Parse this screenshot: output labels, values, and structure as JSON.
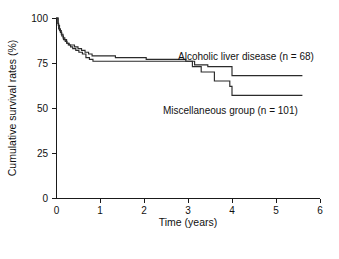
{
  "chart_data": {
    "type": "line",
    "subtype": "kaplan-meier-step",
    "title": "",
    "xlabel": "Time (years)",
    "ylabel": "Cumulative survival rates (%)",
    "xlim": [
      0,
      6
    ],
    "ylim": [
      0,
      100
    ],
    "xticks": [
      0,
      1,
      2,
      3,
      4,
      5,
      6
    ],
    "xtick_labels": [
      "0",
      "1",
      "2",
      "3",
      "4",
      "5",
      "6"
    ],
    "yticks": [
      0,
      25,
      50,
      75,
      100
    ],
    "ytick_labels": [
      "0",
      "25",
      "50",
      "75",
      "100"
    ],
    "grid": false,
    "legend_position": "inline-annotation",
    "line_color": "#2b2b2b",
    "series": [
      {
        "name": "Alcoholic liver disease (n = 68)",
        "annotation": "Alcoholic liver disease (n = 68)",
        "n": 68,
        "final_value": 68,
        "x": [
          0.0,
          0.04,
          0.06,
          0.1,
          0.13,
          0.17,
          0.21,
          0.25,
          0.3,
          0.36,
          0.42,
          0.5,
          0.58,
          0.66,
          0.74,
          0.82,
          0.95,
          1.35,
          1.55,
          2.05,
          2.3,
          2.95,
          3.15,
          3.45,
          4.0,
          5.6
        ],
        "y": [
          100,
          97,
          94,
          92,
          90,
          88,
          87,
          86,
          85,
          85,
          84,
          83,
          82,
          81,
          80,
          79,
          79,
          78,
          78,
          77,
          77,
          76,
          74,
          73,
          68,
          68
        ],
        "step": "post"
      },
      {
        "name": "Miscellaneous group (n = 101)",
        "annotation": "Miscellaneous group (n = 101)",
        "n": 101,
        "final_value": 57,
        "x": [
          0.0,
          0.05,
          0.08,
          0.12,
          0.16,
          0.2,
          0.24,
          0.28,
          0.33,
          0.38,
          0.45,
          0.52,
          0.6,
          0.68,
          0.76,
          0.84,
          0.92,
          1.0,
          1.4,
          1.8,
          2.1,
          2.9,
          3.1,
          3.3,
          3.6,
          3.95,
          4.0,
          5.6
        ],
        "y": [
          100,
          96,
          93,
          91,
          89,
          88,
          86,
          85,
          84,
          83,
          82,
          81,
          80,
          78,
          77,
          76,
          76,
          76,
          76,
          76,
          76,
          76,
          73,
          70,
          65,
          62,
          57,
          57
        ],
        "step": "post"
      }
    ]
  },
  "layout": {
    "plot": {
      "left": 56,
      "right": 320,
      "top": 18,
      "bottom": 198
    },
    "annotations": [
      {
        "key": "alcoholic",
        "x": 178,
        "y": 60
      },
      {
        "key": "miscellaneous",
        "x": 163,
        "y": 114
      }
    ],
    "xlabel_pos": {
      "x": 188,
      "y": 226
    },
    "ylabel_pos": {
      "x": 16,
      "y": 108
    }
  }
}
